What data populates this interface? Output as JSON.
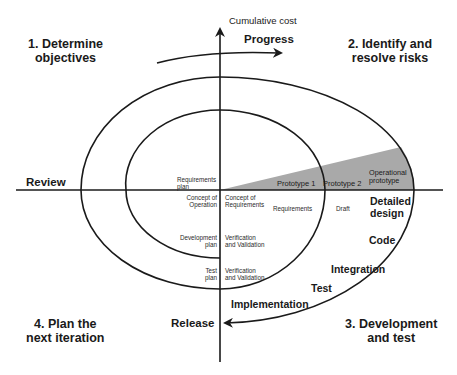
{
  "axes": {
    "vertical_label": "Cumulative cost",
    "progress_label": "Progress",
    "review_label": "Review",
    "release_label": "Release"
  },
  "quadrants": {
    "q1": {
      "line1": "1. Determine",
      "line2": "objectives"
    },
    "q2": {
      "line1": "2. Identify and",
      "line2": "resolve risks"
    },
    "q3": {
      "line1": "3. Development",
      "line2": "and test"
    },
    "q4": {
      "line1": "4. Plan the",
      "line2": "next iteration"
    }
  },
  "prototypes": {
    "p1": "Prototype 1",
    "p2": "Prototype 2",
    "operational": {
      "line1": "Operational",
      "line2": "prototype"
    }
  },
  "planning": {
    "requirements_plan": {
      "line1": "Requirements",
      "line2": "plan"
    },
    "concept_of_operation": {
      "line1": "Concept of",
      "line2": "Operation"
    },
    "development_plan": {
      "line1": "Development",
      "line2": "plan"
    },
    "test_plan": {
      "line1": "Test",
      "line2": "plan"
    }
  },
  "development": {
    "concept_of_requirements": {
      "line1": "Concept of",
      "line2": "Requirements"
    },
    "requirements": "Requirements",
    "draft": "Draft",
    "vv1": {
      "line1": "Verification",
      "line2": "and Validation"
    },
    "vv2": {
      "line1": "Verification",
      "line2": "and Validation"
    }
  },
  "phases": {
    "detailed_design": {
      "line1": "Detailed",
      "line2": "design"
    },
    "code": "Code",
    "integration": "Integration",
    "test": "Test",
    "implementation": "Implementation"
  },
  "colors": {
    "line": "#1a1a1a",
    "shade": "#a9a9a9",
    "background": "#ffffff"
  }
}
